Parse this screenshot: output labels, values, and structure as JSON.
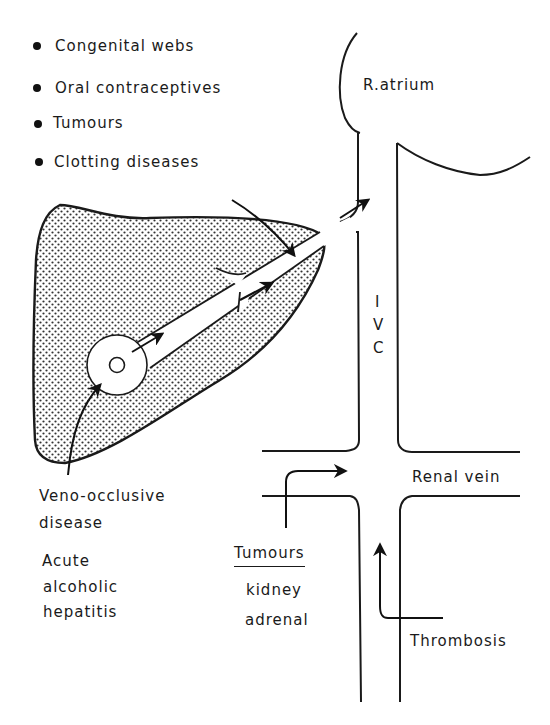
{
  "figure": {
    "causes_list": [
      {
        "label": "Congenital webs"
      },
      {
        "label": "Oral contraceptives"
      },
      {
        "label": "Tumours"
      },
      {
        "label": "Clotting diseases"
      }
    ],
    "structures": {
      "right_atrium": "R.atrium",
      "ivc_letters": [
        "I",
        "V",
        "C"
      ],
      "renal_vein": "Renal vein"
    },
    "liver_causes": {
      "veno_occlusive_line1": "Veno-occlusive",
      "veno_occlusive_line2": "disease",
      "alcoholic_line1": "Acute",
      "alcoholic_line2": "alcoholic",
      "alcoholic_line3": "hepatitis"
    },
    "renal_tumours": {
      "heading": "Tumours",
      "items": [
        "kidney",
        "adrenal"
      ]
    },
    "thrombosis": "Thrombosis",
    "colors": {
      "ink": "#1a1a1a",
      "background": "#ffffff",
      "stipple": "#333333"
    }
  }
}
